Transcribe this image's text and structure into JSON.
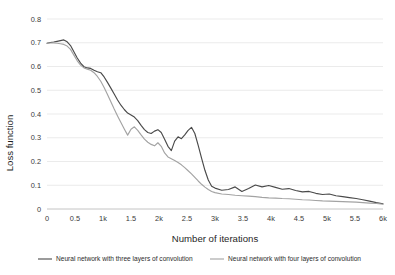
{
  "chart_data": {
    "type": "line",
    "title": "",
    "xlabel": "Number of iterations",
    "ylabel": "Loss function",
    "xlim": [
      0,
      6000
    ],
    "ylim": [
      0,
      0.8
    ],
    "grid": true,
    "legend_position": "bottom",
    "x_tick_labels": [
      "0",
      "0.5",
      "1k",
      "1.5",
      "2k",
      "2.5",
      "3k",
      "3.5",
      "4k",
      "4.5",
      "5k",
      "5.5",
      "6k"
    ],
    "x_tick_values": [
      0,
      500,
      1000,
      1500,
      2000,
      2500,
      3000,
      3500,
      4000,
      4500,
      5000,
      5500,
      6000
    ],
    "y_tick_labels": [
      "0",
      "0.1",
      "0.2",
      "0.3",
      "0.4",
      "0.5",
      "0.6",
      "0.7",
      "0.8"
    ],
    "y_tick_values": [
      0,
      0.1,
      0.2,
      0.3,
      0.4,
      0.5,
      0.6,
      0.7,
      0.8
    ],
    "series": [
      {
        "name": "Neural network with three layers of convolution",
        "color": "#4a4a4a",
        "width": 1.15,
        "x": [
          0,
          60,
          120,
          180,
          240,
          300,
          360,
          420,
          480,
          540,
          600,
          660,
          720,
          780,
          840,
          900,
          960,
          1020,
          1080,
          1140,
          1200,
          1260,
          1320,
          1380,
          1440,
          1500,
          1560,
          1620,
          1680,
          1740,
          1800,
          1860,
          1920,
          1980,
          2040,
          2100,
          2160,
          2220,
          2280,
          2340,
          2400,
          2460,
          2520,
          2580,
          2640,
          2700,
          2760,
          2820,
          2880,
          2940,
          3000,
          3120,
          3240,
          3360,
          3480,
          3600,
          3720,
          3840,
          3960,
          4080,
          4200,
          4320,
          4440,
          4560,
          4680,
          4800,
          4920,
          5040,
          5160,
          5280,
          5400,
          5520,
          5640,
          5760,
          5880,
          6000
        ],
        "y": [
          0.698,
          0.701,
          0.703,
          0.706,
          0.709,
          0.712,
          0.704,
          0.688,
          0.662,
          0.636,
          0.614,
          0.599,
          0.594,
          0.592,
          0.584,
          0.578,
          0.574,
          0.556,
          0.533,
          0.509,
          0.484,
          0.459,
          0.437,
          0.419,
          0.404,
          0.396,
          0.387,
          0.372,
          0.352,
          0.334,
          0.322,
          0.318,
          0.328,
          0.334,
          0.322,
          0.294,
          0.264,
          0.246,
          0.286,
          0.304,
          0.296,
          0.312,
          0.331,
          0.344,
          0.318,
          0.268,
          0.214,
          0.163,
          0.122,
          0.096,
          0.088,
          0.079,
          0.082,
          0.093,
          0.074,
          0.086,
          0.101,
          0.093,
          0.099,
          0.091,
          0.083,
          0.086,
          0.078,
          0.072,
          0.074,
          0.066,
          0.061,
          0.063,
          0.056,
          0.052,
          0.048,
          0.044,
          0.039,
          0.033,
          0.027,
          0.022
        ]
      },
      {
        "name": "Neural network with four layers of convolution",
        "color": "#a3a3a3",
        "width": 1.15,
        "x": [
          0,
          60,
          120,
          180,
          240,
          300,
          360,
          420,
          480,
          540,
          600,
          660,
          720,
          780,
          840,
          900,
          960,
          1020,
          1080,
          1140,
          1200,
          1260,
          1320,
          1380,
          1440,
          1500,
          1560,
          1620,
          1680,
          1740,
          1800,
          1860,
          1920,
          1980,
          2040,
          2100,
          2160,
          2220,
          2280,
          2340,
          2400,
          2460,
          2520,
          2580,
          2640,
          2700,
          2760,
          2820,
          2880,
          2940,
          3000,
          3120,
          3240,
          3360,
          3480,
          3600,
          3720,
          3840,
          3960,
          4080,
          4200,
          4320,
          4440,
          4560,
          4680,
          4800,
          4920,
          5040,
          5160,
          5280,
          5400,
          5520,
          5640,
          5760,
          5880,
          6000
        ],
        "y": [
          0.698,
          0.699,
          0.699,
          0.698,
          0.696,
          0.693,
          0.686,
          0.672,
          0.648,
          0.624,
          0.606,
          0.594,
          0.589,
          0.584,
          0.574,
          0.558,
          0.538,
          0.512,
          0.482,
          0.452,
          0.421,
          0.392,
          0.364,
          0.337,
          0.311,
          0.336,
          0.346,
          0.331,
          0.312,
          0.294,
          0.281,
          0.272,
          0.266,
          0.279,
          0.264,
          0.236,
          0.219,
          0.212,
          0.204,
          0.196,
          0.186,
          0.174,
          0.161,
          0.148,
          0.133,
          0.118,
          0.104,
          0.092,
          0.082,
          0.074,
          0.069,
          0.063,
          0.061,
          0.058,
          0.056,
          0.054,
          0.052,
          0.049,
          0.047,
          0.046,
          0.044,
          0.043,
          0.041,
          0.039,
          0.038,
          0.036,
          0.034,
          0.033,
          0.032,
          0.031,
          0.03,
          0.029,
          0.027,
          0.025,
          0.023,
          0.02
        ]
      }
    ]
  }
}
